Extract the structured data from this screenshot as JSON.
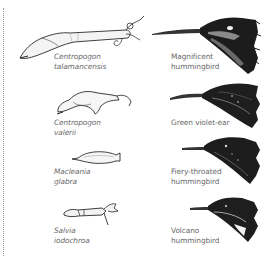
{
  "figure": {
    "pairs": [
      {
        "flower": {
          "genus": "Centropogon",
          "species": "talamancensis"
        },
        "bird": {
          "line1": "Magnificent",
          "line2": "hummingbird"
        }
      },
      {
        "flower": {
          "genus": "Centropogon",
          "species": "valerii"
        },
        "bird": {
          "line1": "Green violet-ear",
          "line2": ""
        }
      },
      {
        "flower": {
          "genus": "Macleania",
          "species": "glabra"
        },
        "bird": {
          "line1": "Fiery-throated",
          "line2": "hummingbird"
        }
      },
      {
        "flower": {
          "genus": "Salvia",
          "species": "iodochroa"
        },
        "bird": {
          "line1": "Volcano",
          "line2": "hummingbird"
        }
      }
    ],
    "colors": {
      "text": "#6a6a6a",
      "ink": "#1a1a1a",
      "border": "#9a9a9a",
      "background": "#ffffff"
    }
  }
}
